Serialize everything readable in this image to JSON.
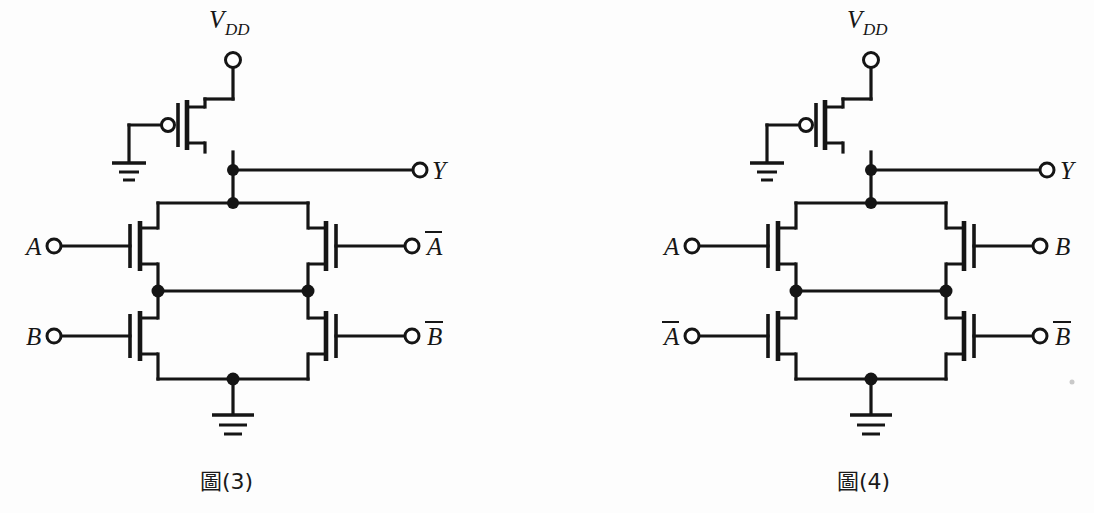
{
  "page": {
    "background": "#fdfdfd",
    "ink_color": "#151515",
    "width": 1094,
    "height": 513
  },
  "figures": [
    {
      "id": "figure-3",
      "caption": "圖(3)",
      "supply_label": "V",
      "supply_subscript": "DD",
      "output_label": "Y",
      "pullup_gate_net": "ground",
      "terminals": [
        {
          "name": "vdd",
          "label": "V",
          "subscript": "DD",
          "overbar": false,
          "side": "top"
        },
        {
          "name": "output-y",
          "label": "Y",
          "subscript": "",
          "overbar": false,
          "side": "right"
        },
        {
          "name": "input-a",
          "label": "A",
          "subscript": "",
          "overbar": false,
          "side": "left"
        },
        {
          "name": "input-b",
          "label": "B",
          "subscript": "",
          "overbar": false,
          "side": "left"
        },
        {
          "name": "input-abar",
          "label": "A",
          "subscript": "",
          "overbar": true,
          "side": "right"
        },
        {
          "name": "input-bbar",
          "label": "B",
          "subscript": "",
          "overbar": true,
          "side": "right"
        }
      ],
      "transistors": [
        {
          "name": "pmos-pullup",
          "type": "pmos",
          "gate_net": "ground",
          "position": "top"
        },
        {
          "name": "nmos-top-left",
          "type": "nmos",
          "gate_net": "A",
          "position": "top-left"
        },
        {
          "name": "nmos-top-right",
          "type": "nmos",
          "gate_net": "A-bar",
          "position": "top-right"
        },
        {
          "name": "nmos-bottom-left",
          "type": "nmos",
          "gate_net": "B",
          "position": "bottom-left"
        },
        {
          "name": "nmos-bottom-right",
          "type": "nmos",
          "gate_net": "B-bar",
          "position": "bottom-right"
        }
      ],
      "grounds": [
        {
          "name": "ground-gate",
          "bars": 3
        },
        {
          "name": "ground-source",
          "bars": 3
        }
      ],
      "junctions": 6
    },
    {
      "id": "figure-4",
      "caption": "圖(4)",
      "supply_label": "V",
      "supply_subscript": "DD",
      "output_label": "Y",
      "pullup_gate_net": "ground",
      "terminals": [
        {
          "name": "vdd",
          "label": "V",
          "subscript": "DD",
          "overbar": false,
          "side": "top"
        },
        {
          "name": "output-y",
          "label": "Y",
          "subscript": "",
          "overbar": false,
          "side": "right"
        },
        {
          "name": "input-a",
          "label": "A",
          "subscript": "",
          "overbar": false,
          "side": "left"
        },
        {
          "name": "input-abar",
          "label": "A",
          "subscript": "",
          "overbar": true,
          "side": "left"
        },
        {
          "name": "input-b",
          "label": "B",
          "subscript": "",
          "overbar": false,
          "side": "right"
        },
        {
          "name": "input-bbar",
          "label": "B",
          "subscript": "",
          "overbar": true,
          "side": "right"
        }
      ],
      "transistors": [
        {
          "name": "pmos-pullup",
          "type": "pmos",
          "gate_net": "ground",
          "position": "top"
        },
        {
          "name": "nmos-top-left",
          "type": "nmos",
          "gate_net": "A",
          "position": "top-left"
        },
        {
          "name": "nmos-top-right",
          "type": "nmos",
          "gate_net": "B",
          "position": "top-right"
        },
        {
          "name": "nmos-bottom-left",
          "type": "nmos",
          "gate_net": "A-bar",
          "position": "bottom-left"
        },
        {
          "name": "nmos-bottom-right",
          "type": "nmos",
          "gate_net": "B-bar",
          "position": "bottom-right"
        }
      ],
      "grounds": [
        {
          "name": "ground-gate",
          "bars": 3
        },
        {
          "name": "ground-source",
          "bars": 3
        }
      ],
      "junctions": 6
    }
  ],
  "labels": {
    "fig3": {
      "vdd": "V",
      "vdd_sub": "DD",
      "y": "Y",
      "left_top": "A",
      "left_bottom": "B",
      "right_top": "A",
      "right_bottom": "B",
      "caption": "圖(3)"
    },
    "fig4": {
      "vdd": "V",
      "vdd_sub": "DD",
      "y": "Y",
      "left_top": "A",
      "left_bottom": "A",
      "right_top": "B",
      "right_bottom": "B",
      "caption": "圖(4)"
    }
  }
}
